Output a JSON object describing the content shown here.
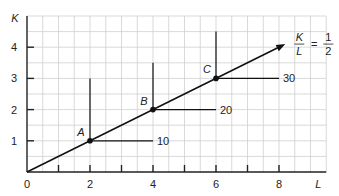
{
  "chart_data": {
    "type": "line",
    "title": "",
    "xlabel": "L",
    "ylabel": "K",
    "xlim": [
      0,
      9.5
    ],
    "ylim": [
      0,
      5
    ],
    "grid": true,
    "grid_step": 0.5,
    "x_ticks": [
      0,
      1,
      2,
      3,
      4,
      5,
      6,
      7,
      8
    ],
    "x_tick_labels": [
      "0",
      "2",
      "4",
      "6",
      "8"
    ],
    "x_tick_label_values": [
      0,
      2,
      4,
      6,
      8
    ],
    "y_ticks": [
      1,
      2,
      3,
      4
    ],
    "y_tick_labels": [
      "1",
      "2",
      "3",
      "4"
    ],
    "ray": {
      "label_num": "K",
      "label_den": "L",
      "equals": "=",
      "value_num": "1",
      "value_den": "2",
      "slope": 0.5,
      "from": [
        0,
        0
      ],
      "to": [
        8.2,
        4.1
      ]
    },
    "isoquants": [
      {
        "point_label": "A",
        "L": 2,
        "K": 1,
        "output": "10",
        "vertical_top_K": 3,
        "horizontal_end_L": 4
      },
      {
        "point_label": "B",
        "L": 4,
        "K": 2,
        "output": "20",
        "vertical_top_K": 3.5,
        "horizontal_end_L": 6
      },
      {
        "point_label": "C",
        "L": 6,
        "K": 3,
        "output": "30",
        "vertical_top_K": 4.5,
        "horizontal_end_L": 8
      }
    ]
  },
  "colors": {
    "grid": "#cfcfcf",
    "axis": "#222222",
    "line": "#111111",
    "text": "#222222"
  }
}
